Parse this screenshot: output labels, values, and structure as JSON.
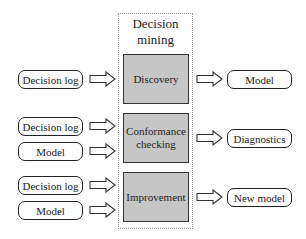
{
  "container": {
    "title": "Decision mining"
  },
  "processes": [
    {
      "label": "Discovery"
    },
    {
      "label": "Conformance checking"
    },
    {
      "label": "Improvement"
    }
  ],
  "inputs": [
    {
      "label": "Decision log"
    },
    {
      "label": "Decision log"
    },
    {
      "label": "Model"
    },
    {
      "label": "Decision log"
    },
    {
      "label": "Model"
    }
  ],
  "outputs": [
    {
      "label": "Model"
    },
    {
      "label": "Diagnostics"
    },
    {
      "label": "New model"
    }
  ],
  "colors": {
    "process_fill": "#c6c6c6",
    "border": "#222222",
    "container_border": "#9a9a9a"
  }
}
